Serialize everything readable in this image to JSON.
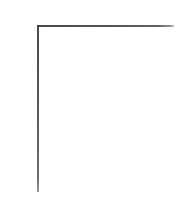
{
  "figure": {
    "title": "",
    "subtitle": "",
    "background_color": "#ffffff",
    "width_px": 192,
    "height_px": 198
  },
  "axes": {
    "spine_color": "#4f4f4f",
    "spine_width_px": 1.6,
    "left_spine": {
      "name": "left-spine",
      "visible": true,
      "x_px": 38,
      "y_start_px": 26,
      "y_end_px": 192
    },
    "top_spine": {
      "name": "top-spine",
      "visible": true,
      "y_px": 26,
      "x_start_px": 38,
      "x_end_px": 175
    },
    "right_spine": {
      "name": "right-spine",
      "visible": false
    },
    "bottom_spine": {
      "name": "bottom-spine",
      "visible": false
    }
  },
  "chart_data": {
    "type": "line",
    "title": "",
    "subtitle": "",
    "xlabel": "",
    "ylabel": "",
    "x": [],
    "series": [],
    "categories": [],
    "values": [],
    "xticks": [],
    "xticklabels": [],
    "yticks": [],
    "yticklabels": [],
    "xlim": [
      0,
      1
    ],
    "ylim": [
      0,
      1
    ],
    "grid": false,
    "legend": false,
    "legend_position": "none",
    "annotations": []
  }
}
